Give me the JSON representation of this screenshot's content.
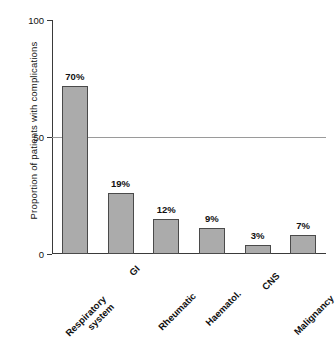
{
  "chart_data": {
    "type": "bar",
    "title": "",
    "xlabel": "",
    "ylabel": "Proportion of patients with complications",
    "categories": [
      "Respiratory\nsystem",
      "GI",
      "Rheumatic",
      "Haematol.",
      "CNS",
      "Malignancy"
    ],
    "values": [
      70,
      19,
      12,
      9,
      3,
      7
    ],
    "data_labels": [
      "70%",
      "19%",
      "12%",
      "9%",
      "3%",
      "7%"
    ],
    "bar_plotted_heights": [
      72,
      26,
      15,
      11,
      4,
      8
    ],
    "ylim": [
      0,
      100
    ],
    "yticks": [
      0,
      50,
      100
    ],
    "ytick_labels": [
      "0",
      "50",
      "100"
    ],
    "grid": true,
    "gridlines_at": [
      50
    ],
    "legend": null,
    "colors": {
      "bar_fill": "#ababab",
      "bar_stroke": "#4a4a4a",
      "axis": "#3a3a3a",
      "gridline": "#9a9a9a",
      "text": "#111111",
      "background": "#ffffff"
    }
  }
}
